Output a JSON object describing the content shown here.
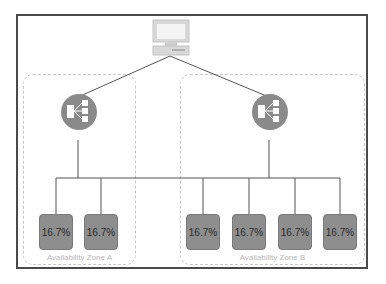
{
  "diagram": {
    "client": {
      "icon": "computer-icon"
    },
    "load_balancers": [
      {
        "icon": "load-balancer-icon",
        "zone": "A"
      },
      {
        "icon": "load-balancer-icon",
        "zone": "B"
      }
    ],
    "zones": [
      {
        "label": "Availability Zone A",
        "nodes": [
          "16.7%",
          "16.7%"
        ]
      },
      {
        "label": "Availability Zone B",
        "nodes": [
          "16.7%",
          "16.7%",
          "16.7%",
          "16.7%"
        ]
      }
    ],
    "colors": {
      "node_fill": "#8e8e8e",
      "line": "#555555",
      "zone_border": "#c8c8c8",
      "frame": "#4a4a4a",
      "lb_fill": "#8a8a8a"
    }
  }
}
